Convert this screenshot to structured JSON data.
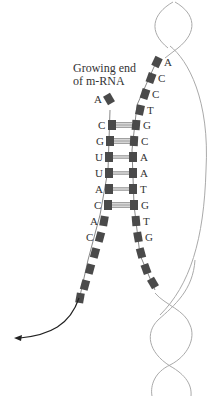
{
  "caption": {
    "line1": "Growing end",
    "line2": "of m-RNA"
  },
  "mrna_strand": {
    "bases": [
      "A",
      "C",
      "G",
      "U",
      "U",
      "A",
      "C",
      "A",
      "C"
    ],
    "loose_base": "A",
    "paired_count": 6
  },
  "dna_template_strand": {
    "bases": [
      "A",
      "C",
      "C",
      "T",
      "G",
      "C",
      "A",
      "A",
      "T",
      "G",
      "T",
      "G"
    ],
    "paired_start_index": 4
  },
  "colors": {
    "block": "#4a4a4a",
    "helix": "#aaaaaa",
    "arrow": "#222222"
  },
  "arrow": {
    "meaning": "direction of mRNA release"
  }
}
